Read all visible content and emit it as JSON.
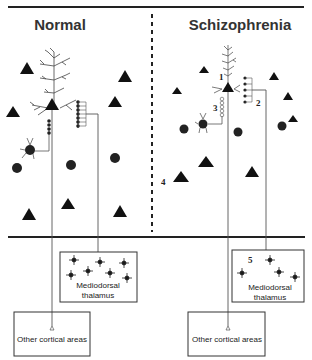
{
  "panels": {
    "left": {
      "title": "Normal"
    },
    "right": {
      "title": "Schizophrenia"
    }
  },
  "boxes": {
    "left_thalamus": {
      "line1": "Mediodorsal",
      "line2": "thalamus"
    },
    "left_cortical": {
      "label": "Other cortical areas"
    },
    "right_thalamus": {
      "line1": "Mediodorsal",
      "line2": "thalamus"
    },
    "right_cortical": {
      "label": "Other cortical areas"
    }
  },
  "annotations": {
    "n1": "1",
    "n2": "2",
    "n3": "3",
    "n4": "4",
    "n5": "5"
  },
  "colors": {
    "ink": "#111111",
    "line": "#555555",
    "text": "#333333"
  }
}
